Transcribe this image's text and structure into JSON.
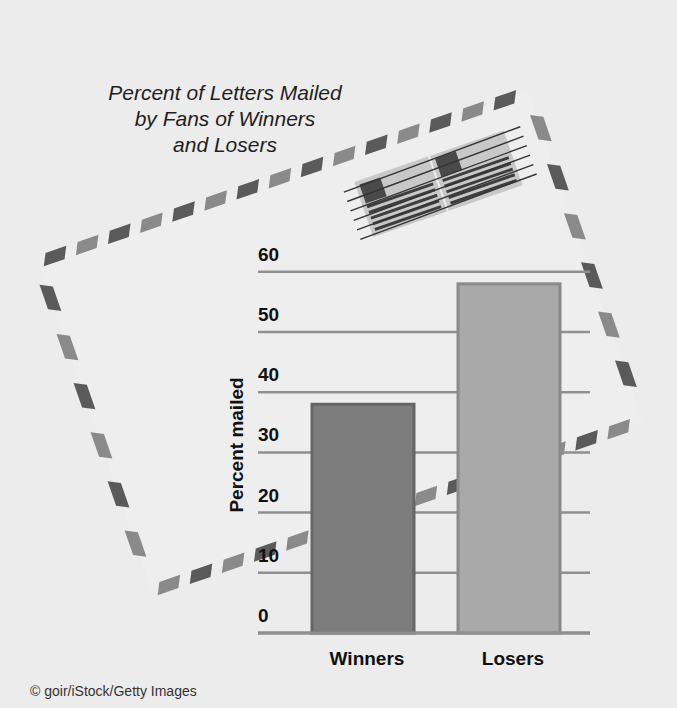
{
  "chart_data": {
    "type": "bar",
    "title": "Percent of Letters Mailed by Fans of Winners and Losers",
    "title_lines": [
      "Percent of Letters Mailed",
      "by Fans of Winners",
      "and Losers"
    ],
    "categories": [
      "Winners",
      "Losers"
    ],
    "values": [
      38,
      58
    ],
    "xlabel": "",
    "ylabel": "Percent mailed",
    "ylim": [
      0,
      60
    ],
    "yticks": [
      "0",
      "10",
      "20",
      "30",
      "40",
      "50",
      "60"
    ],
    "grid": true,
    "legend": null,
    "bar_colors": [
      "#7d7d7d",
      "#a9a9a9"
    ],
    "bar_border_colors": [
      "#666666",
      "#8a8a8a"
    ]
  },
  "image_credit": "© goir/iStock/Getty Images",
  "colors": {
    "background": "#ececec",
    "gridline": "#8f8f8f",
    "text": "#111111"
  }
}
